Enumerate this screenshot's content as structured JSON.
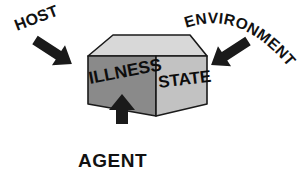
{
  "figure": {
    "type": "concept-diagram",
    "background_color": "#ffffff"
  },
  "cube": {
    "name": "illness-state-box",
    "front_label": "ILLNESS",
    "side_label": "STATE",
    "colors": {
      "top_face": "#d8d8d8",
      "left_face": "#8a8a8a",
      "right_face": "#c2c2c2",
      "edge": "#1a1a1a",
      "text": "#0d0d0d"
    }
  },
  "inputs": [
    {
      "label": "HOST",
      "position": "upper-left",
      "arrow_direction": "down-right",
      "rotation_deg": -21
    },
    {
      "label": "ENVIRONMENT",
      "position": "upper-right",
      "arrow_direction": "down-left",
      "text_shape": "arc"
    },
    {
      "label": "AGENT",
      "position": "bottom-center",
      "arrow_direction": "up",
      "rotation_deg": 0
    }
  ],
  "arrows": {
    "color": "#1a1a1a",
    "style": "solid-block-arrow",
    "count": 3
  }
}
